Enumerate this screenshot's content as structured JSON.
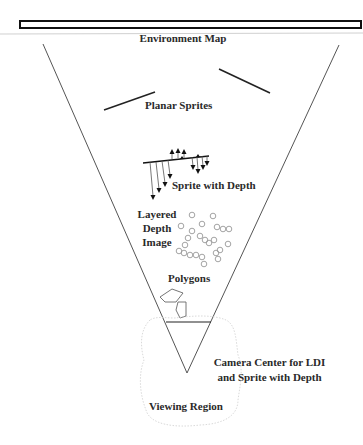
{
  "diagram": {
    "labels": {
      "environment_map": "Environment Map",
      "planar_sprites": "Planar Sprites",
      "sprite_with_depth": "Sprite with Depth",
      "ldi_line1": "Layered",
      "ldi_line2": "Depth",
      "ldi_line3": "Image",
      "polygons": "Polygons",
      "camera_line1": "Camera Center for LDI",
      "camera_line2": "and Sprite with Depth",
      "viewing_region": "Viewing Region"
    },
    "colors": {
      "line": "#333333",
      "text": "#2a2a2a",
      "faint": "#c8c8c8",
      "circle": "#9a9a9a"
    }
  }
}
